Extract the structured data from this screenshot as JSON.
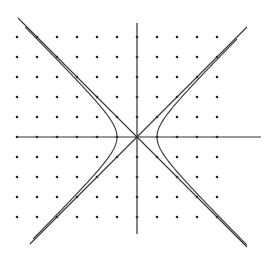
{
  "diagram": {
    "title": "Hyperbola x^2 - y^2 = 1 with asymptotes y = x and y = -x",
    "background": "#ffffff",
    "ink_color": "#333333",
    "dot_color": "#222222",
    "origin_px": [
      137,
      137
    ],
    "unit_px": 20,
    "x_axis": {
      "from": -6,
      "to": 6.2
    },
    "y_axis": {
      "from": -4.85,
      "to": 5.7
    },
    "grid_dots": {
      "x_range": [
        -6,
        4
      ],
      "y_range": [
        -4,
        5
      ],
      "spacing": 1
    },
    "curves": [
      {
        "name": "hyperbola-right-branch",
        "equation": "x^2 - y^2 = 1",
        "branch": "right",
        "y_range": [
          -5.4,
          4.9
        ]
      },
      {
        "name": "hyperbola-left-branch",
        "equation": "x^2 - y^2 = 1",
        "branch": "left",
        "y_range": [
          -5.1,
          5.5
        ]
      },
      {
        "name": "asymptote-positive",
        "equation": "y = x",
        "x_range": [
          -5.35,
          5.5
        ]
      },
      {
        "name": "asymptote-negative",
        "equation": "y = -x",
        "x_range": [
          -5.95,
          5.5
        ]
      }
    ]
  }
}
